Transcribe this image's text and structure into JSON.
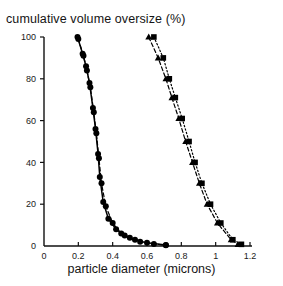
{
  "chart_data": {
    "type": "line",
    "title": "cumulative volume oversize (%)",
    "xlabel": "particle diameter (microns)",
    "ylabel": "",
    "xlim": [
      0,
      1.2
    ],
    "ylim": [
      0,
      100
    ],
    "xticks": [
      0,
      0.2,
      0.4,
      0.6,
      0.8,
      1,
      1.2
    ],
    "xticklabels": [
      "0",
      "0.2",
      "0.4",
      "0.6",
      "0.8",
      "1",
      "1.2"
    ],
    "yticks": [
      0,
      20,
      40,
      60,
      80,
      100
    ],
    "yticklabels": [
      "0",
      "20",
      "40",
      "60",
      "80",
      "100"
    ],
    "grid": false,
    "legend": "none",
    "series": [
      {
        "name": "fine-distribution-solid",
        "marker": "circle",
        "linestyle": "solid",
        "color": "#000000",
        "points": [
          [
            0.195,
            100
          ],
          [
            0.225,
            92
          ],
          [
            0.245,
            86
          ],
          [
            0.265,
            78
          ],
          [
            0.285,
            66
          ],
          [
            0.3,
            56
          ],
          [
            0.315,
            44
          ],
          [
            0.325,
            33
          ],
          [
            0.345,
            21
          ],
          [
            0.375,
            13
          ],
          [
            0.42,
            8
          ],
          [
            0.47,
            5
          ],
          [
            0.53,
            3
          ],
          [
            0.6,
            1.5
          ],
          [
            0.71,
            0.5
          ]
        ]
      },
      {
        "name": "fine-distribution-dashed",
        "marker": "circle",
        "linestyle": "dashed",
        "color": "#000000",
        "points": [
          [
            0.2,
            99
          ],
          [
            0.23,
            91
          ],
          [
            0.25,
            84
          ],
          [
            0.27,
            76
          ],
          [
            0.29,
            64
          ],
          [
            0.305,
            54
          ],
          [
            0.32,
            42
          ],
          [
            0.335,
            30
          ],
          [
            0.36,
            19
          ],
          [
            0.4,
            11
          ],
          [
            0.45,
            6
          ],
          [
            0.5,
            4
          ],
          [
            0.56,
            2
          ],
          [
            0.64,
            1
          ],
          [
            0.71,
            0.3
          ]
        ]
      },
      {
        "name": "coarse-distribution-triangle",
        "marker": "triangle",
        "linestyle": "dashed",
        "color": "#000000",
        "points": [
          [
            0.61,
            100
          ],
          [
            0.665,
            90
          ],
          [
            0.71,
            80
          ],
          [
            0.745,
            71
          ],
          [
            0.785,
            61
          ],
          [
            0.825,
            50
          ],
          [
            0.865,
            40
          ],
          [
            0.905,
            30
          ],
          [
            0.95,
            20
          ],
          [
            1.01,
            11
          ],
          [
            1.09,
            3
          ],
          [
            1.13,
            0.8
          ]
        ]
      },
      {
        "name": "coarse-distribution-square",
        "marker": "square",
        "linestyle": "dotted",
        "color": "#000000",
        "points": [
          [
            0.64,
            100
          ],
          [
            0.695,
            90
          ],
          [
            0.73,
            80
          ],
          [
            0.765,
            71
          ],
          [
            0.805,
            61
          ],
          [
            0.845,
            50
          ],
          [
            0.88,
            40
          ],
          [
            0.92,
            30
          ],
          [
            0.97,
            20
          ],
          [
            1.03,
            11
          ],
          [
            1.1,
            3
          ],
          [
            1.15,
            0.8
          ]
        ]
      }
    ]
  },
  "axes": {
    "title": "cumulative volume oversize (%)",
    "xlabel": "particle diameter (microns)"
  }
}
